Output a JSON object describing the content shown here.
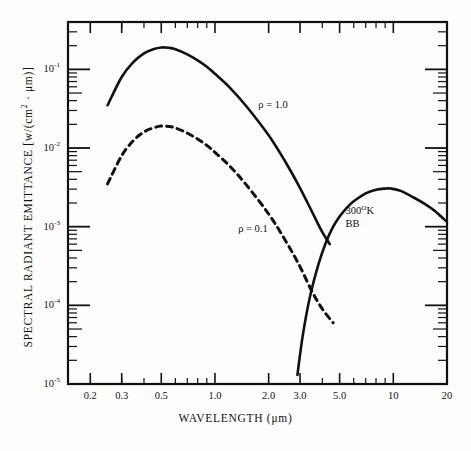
{
  "figure": {
    "background_color": "#fdfdfb",
    "ink_color": "#111111"
  },
  "axes": {
    "x_title": "WAVELENGTH (μm)",
    "y_title": "SPECTRAL RADIANT EMITTANCE [w/(cm² · μm)]",
    "x_tick_labels": [
      "0.2",
      "0.3",
      "0.5",
      "1.0",
      "2.0",
      "3.0",
      "5.0",
      "10",
      "20"
    ],
    "y_tick_labels": [
      "10",
      "10",
      "10",
      "10",
      "10"
    ],
    "y_tick_exponents": [
      "-1",
      "-2",
      "-3",
      "-4",
      "-5"
    ]
  },
  "annotations": {
    "rho_one": "ρ = 1.0",
    "rho_tenth": "ρ = 0.1",
    "bb_temp": "300",
    "bb_temp_sup": "O",
    "bb_temp_unit": "K",
    "bb_label": "BB"
  },
  "chart_data": {
    "type": "line",
    "title": "",
    "xlabel": "WAVELENGTH (μm)",
    "ylabel": "SPECTRAL RADIANT EMITTANCE [w/(cm² · μm)]",
    "xscale": "log",
    "yscale": "log",
    "xlim": [
      0.15,
      20
    ],
    "ylim": [
      1e-05,
      0.4
    ],
    "xticks": [
      0.2,
      0.3,
      0.5,
      1.0,
      2.0,
      3.0,
      5.0,
      10,
      20
    ],
    "ytick_values": [
      0.1,
      0.01,
      0.001,
      0.0001,
      1e-05
    ],
    "grid": false,
    "legend": "inline-annotations",
    "series": [
      {
        "name": "ρ = 1.0",
        "style": "solid",
        "annotation": "ρ = 1.0",
        "x": [
          0.25,
          0.3,
          0.35,
          0.4,
          0.45,
          0.5,
          0.55,
          0.6,
          0.7,
          0.8,
          0.9,
          1.0,
          1.2,
          1.5,
          2.0,
          2.5,
          3.0,
          3.5,
          4.0,
          4.4
        ],
        "y": [
          0.035,
          0.08,
          0.125,
          0.16,
          0.18,
          0.19,
          0.188,
          0.18,
          0.155,
          0.13,
          0.108,
          0.088,
          0.06,
          0.034,
          0.0145,
          0.0065,
          0.0031,
          0.00155,
          0.00085,
          0.0006
        ]
      },
      {
        "name": "ρ = 0.1",
        "style": "dashed",
        "annotation": "ρ = 0.1",
        "x": [
          0.25,
          0.3,
          0.35,
          0.4,
          0.45,
          0.5,
          0.55,
          0.6,
          0.7,
          0.8,
          0.9,
          1.0,
          1.2,
          1.5,
          2.0,
          2.5,
          3.0,
          3.5,
          4.0,
          4.6
        ],
        "y": [
          0.0035,
          0.008,
          0.0125,
          0.016,
          0.018,
          0.019,
          0.0188,
          0.018,
          0.0155,
          0.013,
          0.0108,
          0.0088,
          0.006,
          0.0034,
          0.00145,
          0.00065,
          0.00031,
          0.00015,
          9e-05,
          6e-05
        ]
      },
      {
        "name": "300 K blackbody",
        "style": "solid",
        "annotation": "300°K BB",
        "x": [
          2.9,
          3.1,
          3.4,
          3.8,
          4.2,
          4.6,
          5.0,
          5.5,
          6.0,
          7.0,
          8.0,
          9.0,
          9.7,
          11.0,
          13.0,
          15.0,
          17.0,
          20.0
        ],
        "y": [
          1.3e-05,
          4e-05,
          0.000125,
          0.00033,
          0.00064,
          0.001,
          0.00135,
          0.00175,
          0.0021,
          0.00265,
          0.00295,
          0.00305,
          0.00305,
          0.00285,
          0.00235,
          0.00195,
          0.0016,
          0.00115
        ]
      }
    ]
  }
}
